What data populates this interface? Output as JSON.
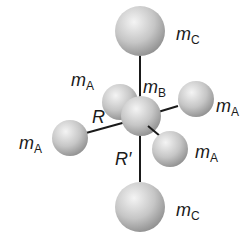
{
  "diagram": {
    "type": "molecular-structure",
    "colors": {
      "bond": "#1a1a1a",
      "sphere_light": "#f2f2f2",
      "sphere_mid": "#c8c8c8",
      "sphere_dark": "#8c8c8c",
      "text": "#1a1a1a"
    },
    "labels": {
      "mc_top": {
        "base": "m",
        "sub": "C"
      },
      "ma_upleft": {
        "base": "m",
        "sub": "A"
      },
      "mb": {
        "base": "m",
        "sub": "B"
      },
      "ma_right": {
        "base": "m",
        "sub": "A"
      },
      "ma_left": {
        "base": "m",
        "sub": "A"
      },
      "ma_lowright": {
        "base": "m",
        "sub": "A"
      },
      "mc_bottom": {
        "base": "m",
        "sub": "C"
      },
      "r": "R",
      "r_prime": "R′"
    }
  }
}
